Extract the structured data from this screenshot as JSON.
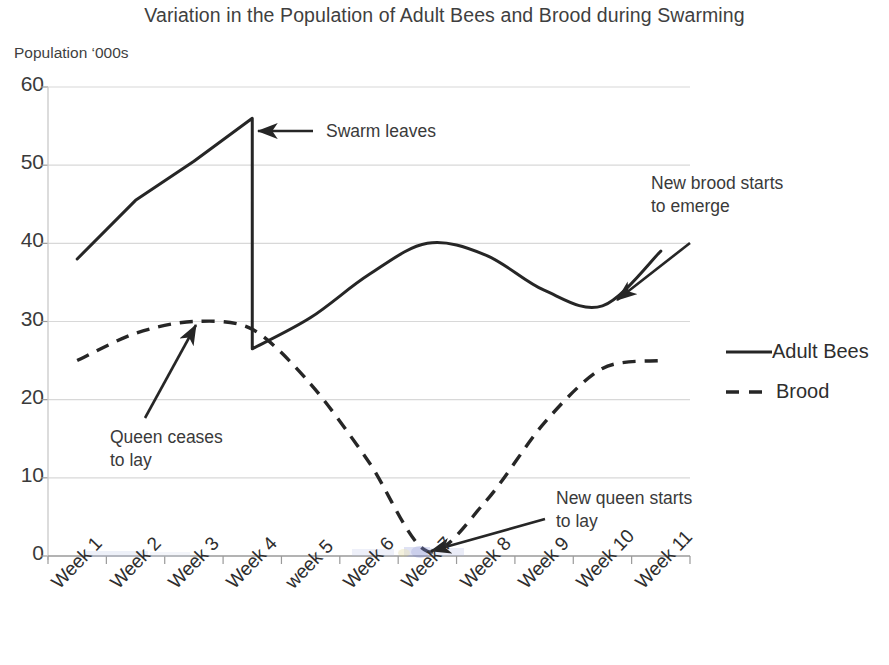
{
  "chart_data": {
    "type": "line",
    "title": "Variation in the Population of Adult Bees and Brood during Swarming",
    "ylabel": "Population ‘000s",
    "xlabel": "",
    "ylim": [
      0,
      60
    ],
    "ytick_values": [
      60,
      50,
      40,
      30,
      20,
      10,
      0
    ],
    "ytick_labels": [
      "60",
      "50",
      "40",
      "30",
      "20",
      "10",
      "0"
    ],
    "grid": true,
    "legend_position": "right",
    "categories": [
      "Week 1",
      "Week 2",
      "Week 3",
      "Week 4",
      "week 5",
      "Week 6",
      "Week 7",
      "Week 8",
      "Week 9",
      "Week 10",
      "Week 11"
    ],
    "series": [
      {
        "name": "Adult Bees",
        "style": "solid",
        "color": "#262626",
        "values": [
          38,
          45.5,
          50.5,
          56,
          30.5,
          36,
          40,
          38.5,
          34,
          32,
          39
        ],
        "note": "Vertical drop at Week 4 from 56 to 26.5 (swarm departure)",
        "drop_at": "Week 4",
        "drop_from": 56,
        "drop_to": 26.5
      },
      {
        "name": "Brood",
        "style": "dashed",
        "color": "#262626",
        "values": [
          25,
          28.5,
          30,
          29,
          22,
          12,
          0.6,
          7,
          17,
          24,
          25
        ]
      }
    ],
    "annotations": [
      {
        "id": "swarm-leaves",
        "text": "Swarm leaves",
        "target": "Week 4 top of drop"
      },
      {
        "id": "queen-ceases-to-lay",
        "text": "Queen ceases\nto lay",
        "target": "Brood peak near Week 3"
      },
      {
        "id": "new-brood-starts-to-emerge",
        "text": "New brood starts\nto emerge",
        "target": "Adult Bees trough near Week 10"
      },
      {
        "id": "new-queen-starts-to-lay",
        "text": "New queen starts\nto lay",
        "target": "Brood minimum near Week 7"
      }
    ]
  },
  "legend": {
    "items": [
      {
        "label": "Adult Bees",
        "style": "solid"
      },
      {
        "label": "Brood",
        "style": "dashed"
      }
    ]
  },
  "colors": {
    "line": "#262626",
    "grid": "#d8d8d8",
    "text": "#3a3a3a"
  }
}
